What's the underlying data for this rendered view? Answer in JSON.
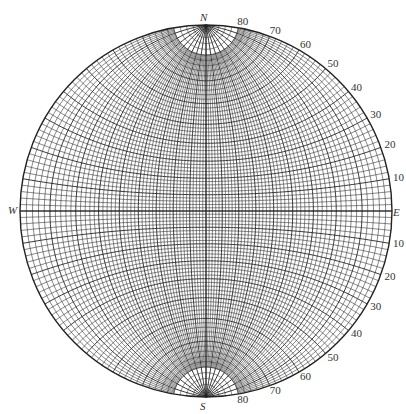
{
  "diagram": {
    "type": "wulff-stereonet",
    "center": [
      206,
      211
    ],
    "radius": 186,
    "grid_interval_deg": 2,
    "line_color": "#222222",
    "background": "#ffffff"
  },
  "directions": {
    "north": "N",
    "south": "S",
    "east": "E",
    "west": "W"
  },
  "right_labels_upper": [
    "80",
    "70",
    "60",
    "50",
    "40",
    "30",
    "20",
    "10"
  ],
  "right_labels_lower": [
    "10",
    "20",
    "30",
    "40",
    "50",
    "60",
    "70",
    "80"
  ]
}
